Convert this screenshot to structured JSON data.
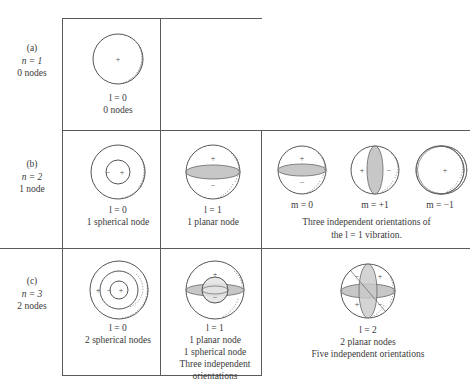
{
  "figure": {
    "rows": [
      {
        "id": "a",
        "tag": "(a)",
        "n_label": "n = 1",
        "nodes_label": "0 nodes",
        "cells": [
          {
            "id": "a-l0",
            "l_label": "l = 0",
            "caption_lines": [
              "0 nodes"
            ],
            "signs": [
              "+"
            ]
          }
        ]
      },
      {
        "id": "b",
        "tag": "(b)",
        "n_label": "n = 2",
        "nodes_label": "1 node",
        "cells": [
          {
            "id": "b-l0",
            "l_label": "l = 0",
            "caption_lines": [
              "1 spherical node"
            ],
            "signs": [
              "−",
              "+"
            ]
          },
          {
            "id": "b-l1",
            "l_label": "l = 1",
            "caption_lines": [
              "1 planar node"
            ],
            "signs": [
              "+",
              "−"
            ]
          }
        ],
        "orientations": {
          "items": [
            {
              "id": "b-m0",
              "label": "m = 0"
            },
            {
              "id": "b-mp1",
              "label": "m = +1"
            },
            {
              "id": "b-mm1",
              "label": "m = −1"
            }
          ],
          "caption_lines": [
            "Three independent orientations of",
            "the l = 1 vibration."
          ]
        }
      },
      {
        "id": "c",
        "tag": "(c)",
        "n_label": "n = 3",
        "nodes_label": "2 nodes",
        "cells": [
          {
            "id": "c-l0",
            "l_label": "l = 0",
            "caption_lines": [
              "2 spherical nodes"
            ],
            "signs": [
              "+",
              "−",
              "+"
            ]
          },
          {
            "id": "c-l1",
            "l_label": "l = 1",
            "caption_lines": [
              "1 planar node",
              "1 spherical node",
              "Three independent",
              "orientations"
            ],
            "signs": [
              "+",
              "−"
            ]
          },
          {
            "id": "c-l2",
            "l_label": "l = 2",
            "caption_lines": [
              "2 planar nodes",
              "Five independent orientations"
            ],
            "signs": [
              "−",
              "+",
              "+",
              "−"
            ]
          }
        ]
      }
    ],
    "colors": {
      "rule": "#5a5a5a",
      "outline": "#555555",
      "node_plane": "#bdbdbd",
      "text": "#3a3a3a",
      "background": "#ffffff"
    }
  }
}
